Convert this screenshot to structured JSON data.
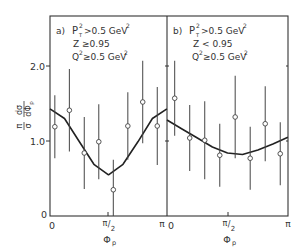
{
  "chart_data": [
    {
      "type": "scatter",
      "panel_label": "a)",
      "cuts": [
        "P_T^2 > 0.5 GeV^2",
        "Z ≥ 0.95",
        "Q^2 ≥ 0.5 GeV^2"
      ],
      "cut_lines": [
        {
          "main": "P",
          "sup": "2",
          "sub": "T",
          "rest": ">0.5 GeV",
          "rest_sup": "2"
        },
        {
          "main": "Z ≥0.95"
        },
        {
          "main": "Q",
          "sup": "2",
          "rest": "≥0.5 GeV",
          "rest_sup": "2"
        }
      ],
      "xlabel": "Φp",
      "ylabel": "π/σ dσ/dΦp",
      "x_ticks": [
        "0",
        "π/2",
        "π"
      ],
      "y_ticks": [
        "0",
        "1.0",
        "2.0"
      ],
      "ylim": [
        0,
        2.0
      ],
      "xlim": [
        0,
        3.1416
      ],
      "x": [
        0.13,
        0.52,
        0.92,
        1.31,
        1.7,
        2.09,
        2.49,
        2.88
      ],
      "values": [
        1.19,
        1.41,
        0.84,
        0.99,
        0.35,
        1.2,
        1.52,
        1.2
      ],
      "errors": [
        0.42,
        0.55,
        0.48,
        0.5,
        0.4,
        0.45,
        0.55,
        0.52
      ],
      "fit_curve": {
        "x": [
          0,
          0.39,
          0.79,
          1.18,
          1.57,
          1.96,
          2.36,
          2.75,
          3.14
        ],
        "y": [
          1.43,
          1.3,
          0.99,
          0.69,
          0.55,
          0.69,
          0.99,
          1.3,
          1.43
        ]
      }
    },
    {
      "type": "scatter",
      "panel_label": "b)",
      "cuts": [
        "P_T^2 > 0.5 GeV^2",
        "Z < 0.95",
        "Q^2 ≥ 0.5 GeV^2"
      ],
      "cut_lines": [
        {
          "main": "P",
          "sup": "2",
          "sub": "T",
          "rest": ">0.5 GeV",
          "rest_sup": "2"
        },
        {
          "main": "Z < 0.95"
        },
        {
          "main": "Q",
          "sup": "2",
          "rest": "≥0.5 GeV",
          "rest_sup": "2"
        }
      ],
      "xlabel": "Φp",
      "ylabel": "π/σ dσ/dΦp",
      "x_ticks": [
        "0",
        "π/2",
        "π"
      ],
      "ylim": [
        0,
        2.0
      ],
      "xlim": [
        0,
        3.1416
      ],
      "x": [
        0.2,
        0.59,
        0.98,
        1.37,
        1.77,
        2.16,
        2.55,
        2.94
      ],
      "values": [
        1.57,
        1.04,
        1.01,
        0.81,
        1.32,
        0.77,
        1.23,
        0.83
      ],
      "errors": [
        0.5,
        0.44,
        0.52,
        0.42,
        0.55,
        0.42,
        0.5,
        0.42
      ],
      "fit_curve": {
        "x": [
          0,
          0.39,
          0.79,
          1.18,
          1.57,
          1.96,
          2.36,
          2.75,
          3.14
        ],
        "y": [
          1.28,
          1.16,
          1.04,
          0.92,
          0.84,
          0.82,
          0.88,
          0.96,
          1.05
        ]
      }
    }
  ],
  "labels": {
    "ytick_0": "0",
    "ytick_1": "1.0",
    "ytick_2": "2.0",
    "xtick_a_0": "0",
    "xtick_a_pi": "π",
    "xtick_b_0": "0",
    "xtick_b_pi": "π",
    "pi": "π",
    "two": "2",
    "xlabel_a": "Φ",
    "xlabel_b": "Φ",
    "xlabel_sub": "p",
    "ylabel_pi": "π",
    "ylabel_sigma": "σ",
    "ylabel_dsigma": "dσ",
    "ylabel_dphi": "dΦ",
    "ylabel_dphi_sub": "p",
    "panel_a": "a)",
    "panel_b": "b)",
    "a_line1_main": "P",
    "a_line1_sup": "2",
    "a_line1_sub": "T",
    "a_line1_rest": ">0.5 GeV",
    "a_line1_rsup": "2",
    "a_line2": "Z ≥0.95",
    "a_line3_main": "Q",
    "a_line3_sup": "2",
    "a_line3_rest": "≥0.5 GeV",
    "a_line3_rsup": "2",
    "b_line1_main": "P",
    "b_line1_sup": "2",
    "b_line1_sub": "T",
    "b_line1_rest": ">0.5 GeV",
    "b_line1_rsup": "2",
    "b_line2": "Z < 0.95",
    "b_line3_main": "Q",
    "b_line3_sup": "2",
    "b_line3_rest": "≥0.5 GeV",
    "b_line3_rsup": "2"
  }
}
